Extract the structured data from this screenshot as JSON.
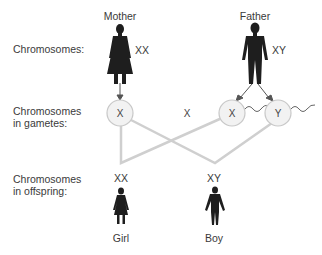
{
  "row_labels": {
    "chromosomes": "Chromosomes:",
    "gametes_line1": "Chromosomes",
    "gametes_line2": "in gametes:",
    "offspring_line1": "Chromosomes",
    "offspring_line2": "in offspring:"
  },
  "parents": {
    "mother": {
      "label": "Mother",
      "chromosomes": "XX"
    },
    "father": {
      "label": "Father",
      "chromosomes": "XY"
    }
  },
  "gametes": {
    "mother_egg": "X",
    "alternative_egg": "X",
    "father_sperm_x": "X",
    "father_sperm_y": "Y"
  },
  "offspring": {
    "girl": {
      "label": "Girl",
      "chromosomes": "XX"
    },
    "boy": {
      "label": "Boy",
      "chromosomes": "XY"
    }
  },
  "colors": {
    "figure": "#1e1e1e",
    "lines": "#cfcfcf",
    "circle_fill": "#f2f2f2",
    "circle_stroke": "#c8c8c8",
    "arrow": "#555555"
  }
}
